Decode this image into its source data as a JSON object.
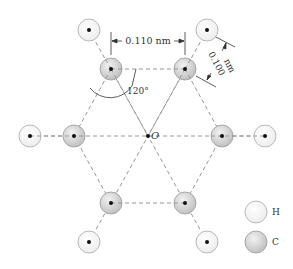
{
  "diagram": {
    "center_label": "O",
    "dimensions": {
      "cc_distance": "0.110 nm",
      "ch_distance_line1": "0.100",
      "ch_distance_line2": "nm",
      "angle": "120°"
    },
    "legend": [
      {
        "symbol": "H",
        "name": "hydrogen"
      },
      {
        "symbol": "C",
        "name": "carbon"
      }
    ],
    "colors": {
      "carbon_fill": "#d6d6d6",
      "hydrogen_fill": "#f7f7f7",
      "outline": "#9a9a9a",
      "bond_dash": "#8a8a8a",
      "nucleus": "#111111"
    }
  }
}
